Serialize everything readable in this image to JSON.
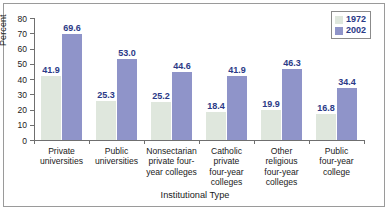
{
  "chart_data": {
    "type": "bar",
    "title": "",
    "xlabel": "Institutional Type",
    "ylabel": "Percent",
    "ylim": [
      0,
      80
    ],
    "yticks": [
      0,
      10,
      20,
      30,
      40,
      50,
      60,
      70,
      80
    ],
    "grid": false,
    "legend_position": "top-right",
    "categories": [
      "Private universities",
      "Public universities",
      "Nonsectarian private four-year colleges",
      "Catholic private four-year colleges",
      "Other religious four-year colleges",
      "Public four-year college"
    ],
    "category_lines": [
      [
        "Private",
        "universities"
      ],
      [
        "Public",
        "universities"
      ],
      [
        "Nonsectarian",
        "private four-",
        "year colleges"
      ],
      [
        "Catholic",
        "private",
        "four-year",
        "colleges"
      ],
      [
        "Other",
        "religious",
        "four-year",
        "colleges"
      ],
      [
        "Public",
        "four-year",
        "college"
      ]
    ],
    "series": [
      {
        "name": "1972",
        "color": "#dfe7dd",
        "values": [
          41.9,
          25.3,
          25.2,
          18.4,
          19.9,
          16.8
        ],
        "labels": [
          "41.9",
          "25.3",
          "25.2",
          "18.4",
          "19.9",
          "16.8"
        ]
      },
      {
        "name": "2002",
        "color": "#8f94c9",
        "values": [
          69.6,
          53.0,
          44.6,
          41.9,
          46.3,
          34.4
        ],
        "labels": [
          "69.6",
          "53.0",
          "44.6",
          "41.9",
          "46.3",
          "34.4"
        ]
      }
    ]
  },
  "legend": {
    "entries": [
      {
        "label": "1972"
      },
      {
        "label": "2002"
      }
    ]
  },
  "axes": {
    "y_title": "Percent",
    "x_title": "Institutional Type",
    "y_tick_labels": [
      "80",
      "70",
      "60",
      "50",
      "40",
      "30",
      "20",
      "10",
      "0"
    ]
  }
}
